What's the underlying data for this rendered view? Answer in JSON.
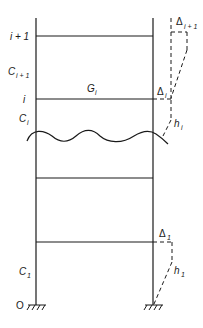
{
  "diagram": {
    "type": "multi-storey frame with lateral inter-storey drift",
    "colors": {
      "line": "#1a1a1a",
      "background": "#ffffff"
    },
    "floor_labels": {
      "top": {
        "main": "i + 1"
      },
      "mid": {
        "main": "i"
      }
    },
    "column_labels": {
      "upper": {
        "main": "C",
        "sub": "i + 1"
      },
      "middle": {
        "main": "C",
        "sub": "i"
      },
      "bottom": {
        "main": "C",
        "sub": "1"
      }
    },
    "beam_label": {
      "main": "G",
      "sub": "i"
    },
    "drift_labels": {
      "upper": {
        "main": "Δ",
        "sub": "i + 1"
      },
      "middle": {
        "main": "Δ",
        "sub": "i"
      },
      "bottom": {
        "main": "Δ",
        "sub": "1"
      }
    },
    "height_labels": {
      "middle": {
        "main": "h",
        "sub": "i"
      },
      "bottom": {
        "main": "h",
        "sub": "1"
      }
    },
    "origin_label": "O"
  }
}
